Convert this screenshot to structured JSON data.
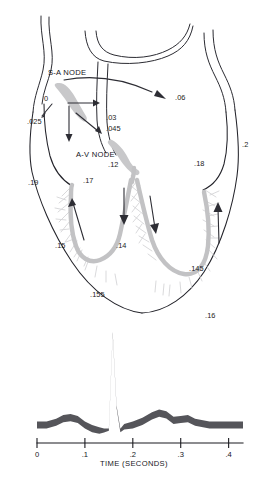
{
  "figure": {
    "type": "cardiac-conduction-timing-diagram"
  },
  "heart_diagram": {
    "node_labels": [
      {
        "id": "sa-node",
        "text": "S-A NODE",
        "x": 48,
        "y": 75
      },
      {
        "id": "av-node",
        "text": "A-V NODE",
        "x": 76,
        "y": 157
      }
    ],
    "timing_labels": [
      {
        "id": "t-0",
        "text": "0",
        "x": 44,
        "y": 101
      },
      {
        "id": "t-025",
        "text": ".025",
        "x": 27,
        "y": 124
      },
      {
        "id": "t-03",
        "text": ".03",
        "x": 106,
        "y": 120
      },
      {
        "id": "t-045",
        "text": ".045",
        "x": 106,
        "y": 131
      },
      {
        "id": "t-06",
        "text": ".06",
        "x": 175,
        "y": 100
      },
      {
        "id": "t-12",
        "text": ".12",
        "x": 108,
        "y": 167
      },
      {
        "id": "t-18",
        "text": ".18",
        "x": 194,
        "y": 166
      },
      {
        "id": "t-2",
        "text": ".2",
        "x": 242,
        "y": 147
      },
      {
        "id": "t-19",
        "text": ".19",
        "x": 28,
        "y": 185
      },
      {
        "id": "t-17",
        "text": ".17",
        "x": 83,
        "y": 183
      },
      {
        "id": "t-15",
        "text": ".15",
        "x": 55,
        "y": 248
      },
      {
        "id": "t-14",
        "text": ".14",
        "x": 116,
        "y": 248
      },
      {
        "id": "t-145",
        "text": ".145",
        "x": 189,
        "y": 271
      },
      {
        "id": "t-155",
        "text": ".155",
        "x": 90,
        "y": 297
      },
      {
        "id": "t-16",
        "text": ".16",
        "x": 205,
        "y": 318
      }
    ]
  },
  "chart_data": {
    "type": "line",
    "title": "",
    "xlabel": "TIME (SECONDS)",
    "ylabel": "",
    "xlim": [
      0,
      0.43
    ],
    "grid": false,
    "legend": null,
    "tick_labels": [
      "0",
      ".1",
      ".2",
      ".3",
      ".4"
    ],
    "tick_values": [
      0,
      0.1,
      0.2,
      0.3,
      0.4
    ],
    "series": [
      {
        "name": "ECG",
        "x": [
          0.0,
          0.02,
          0.04,
          0.055,
          0.07,
          0.085,
          0.1,
          0.115,
          0.13,
          0.14,
          0.15,
          0.158,
          0.166,
          0.174,
          0.182,
          0.2,
          0.22,
          0.24,
          0.255,
          0.27,
          0.285,
          0.3,
          0.315,
          0.33,
          0.36,
          0.4,
          0.43
        ],
        "y": [
          0.0,
          0.0,
          0.03,
          0.07,
          0.08,
          0.06,
          0.0,
          -0.04,
          -0.06,
          -0.06,
          -0.05,
          1.0,
          0.2,
          -0.06,
          -0.02,
          0.0,
          0.04,
          0.1,
          0.13,
          0.11,
          0.05,
          0.06,
          0.07,
          0.03,
          0.0,
          0.0,
          0.0
        ],
        "waves": [
          {
            "name": "P",
            "center": 0.07
          },
          {
            "name": "QRS",
            "center": 0.158
          },
          {
            "name": "T",
            "center": 0.255
          }
        ]
      }
    ]
  }
}
